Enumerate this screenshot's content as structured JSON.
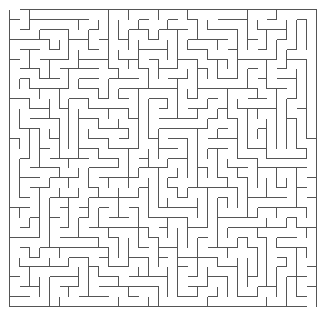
{
  "maze": {
    "cols": 31,
    "rows": 30,
    "cell_size": 9.9,
    "origin_x": 9,
    "origin_y": 9,
    "wall_color": "#555555",
    "background_color": "#ffffff",
    "entrance": {
      "side": "top",
      "col": 0
    },
    "exit": {
      "side": "bottom",
      "col": 30
    }
  }
}
